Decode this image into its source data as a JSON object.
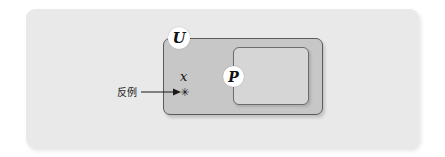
{
  "figure": {
    "type": "set-diagram",
    "panel": {
      "background_color": "#e9e9e9"
    },
    "sets": [
      {
        "id": "universe",
        "label": "U",
        "fill_color": "#c7c7c7",
        "border_color": "#5a5a5a"
      },
      {
        "id": "subset",
        "label": "P",
        "fill_color": "#d6d6d6",
        "border_color": "#6b6b6b"
      }
    ],
    "element": {
      "label": "x",
      "marker": "✳"
    },
    "annotation": {
      "text": "反例",
      "arrow": "→"
    }
  }
}
